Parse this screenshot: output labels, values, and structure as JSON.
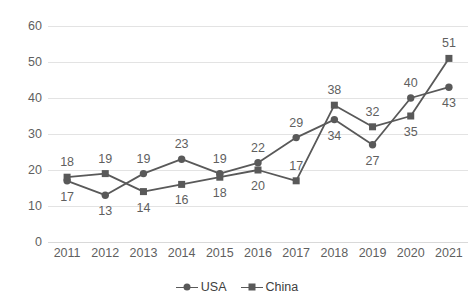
{
  "chart_data": {
    "type": "line",
    "title": "",
    "subtitle": "",
    "xlabel": "",
    "ylabel": "",
    "categories": [
      "2011",
      "2012",
      "2013",
      "2014",
      "2015",
      "2016",
      "2017",
      "2018",
      "2019",
      "2020",
      "2021"
    ],
    "series": [
      {
        "name": "USA",
        "marker": "circle",
        "color": "#595959",
        "values": [
          17,
          13,
          19,
          23,
          19,
          22,
          29,
          34,
          27,
          40,
          43
        ],
        "label_positions": [
          "below",
          "below",
          "above",
          "above",
          "above",
          "above",
          "above",
          "below",
          "below",
          "above",
          "below"
        ]
      },
      {
        "name": "China",
        "marker": "square",
        "color": "#595959",
        "values": [
          18,
          19,
          14,
          16,
          18,
          20,
          17,
          38,
          32,
          35,
          51
        ],
        "label_positions": [
          "above",
          "above",
          "below",
          "below",
          "below",
          "below",
          "above",
          "above",
          "above",
          "below",
          "above"
        ]
      }
    ],
    "ylim": [
      0,
      60
    ],
    "yticks": [
      0,
      10,
      20,
      30,
      40,
      50,
      60
    ],
    "ytick_labels": [
      "0",
      "10",
      "20",
      "30",
      "40",
      "50",
      "60"
    ],
    "grid": true,
    "grid_color": "#e3e3e3",
    "legend_position": "bottom",
    "show_data_labels": true,
    "label_color": "#5f5f5f",
    "axis_text_color": "#5f5f5f",
    "background": "#ffffff"
  },
  "legend": {
    "items": [
      {
        "label": "USA",
        "marker": "circle",
        "color": "#595959"
      },
      {
        "label": "China",
        "marker": "square",
        "color": "#595959"
      }
    ]
  }
}
